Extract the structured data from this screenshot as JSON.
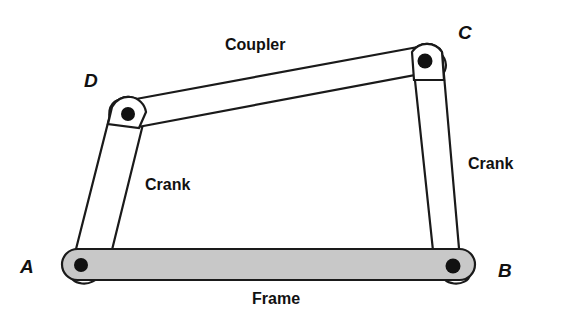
{
  "joints": {
    "a": "A",
    "b": "B",
    "c": "C",
    "d": "D"
  },
  "links": {
    "coupler": "Coupler",
    "crank_left": "Crank",
    "crank_right": "Crank",
    "frame": "Frame"
  },
  "colors": {
    "frame_fill": "#c8c8c8",
    "stroke": "#1a1a1a",
    "pin": "#111111"
  }
}
